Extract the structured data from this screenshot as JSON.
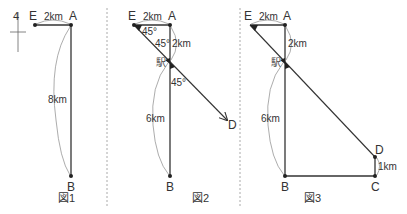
{
  "colors": {
    "line": "#333333",
    "arc": "#888888",
    "divider": "#aaaaaa",
    "text": "#333333"
  },
  "north_marker": {
    "glyph": "4"
  },
  "figures": [
    {
      "caption": "図1",
      "points": {
        "E": "E",
        "A": "A",
        "B": "B"
      },
      "distances": {
        "EA": "2km",
        "AB": "8km"
      }
    },
    {
      "caption": "図2",
      "points": {
        "E": "E",
        "A": "A",
        "B": "B",
        "D": "D"
      },
      "station": "駅",
      "distances": {
        "EA": "2km",
        "A_station": "2km",
        "station_B": "6km"
      },
      "angles": {
        "at_E": "45°",
        "at_station_upper": "45°",
        "at_station_lower": "45°"
      }
    },
    {
      "caption": "図3",
      "points": {
        "E": "E",
        "A": "A",
        "B": "B",
        "C": "C",
        "D": "D"
      },
      "station": "駅",
      "distances": {
        "EA": "2km",
        "A_station": "2km",
        "station_B": "6km",
        "CD": "1km"
      }
    }
  ]
}
